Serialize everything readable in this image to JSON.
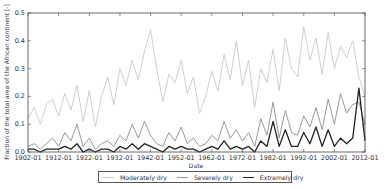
{
  "chart_data": {
    "type": "line",
    "title": "",
    "xlabel": "Date",
    "ylabel": "Fraction of the total area of the African continent [-]",
    "xlim": [
      1902,
      2012
    ],
    "ylim": [
      0.0,
      0.5
    ],
    "x_ticks": [
      "1902-01",
      "1912-01",
      "1922-01",
      "1932-01",
      "1942-01",
      "1952-01",
      "1962-01",
      "1972-01",
      "1982-01",
      "1992-01",
      "2002-01",
      "2012-01"
    ],
    "y_ticks": [
      "0.0",
      "0.1",
      "0.2",
      "0.3",
      "0.4",
      "0.5"
    ],
    "grid": false,
    "legend_position": "below",
    "x": [
      1902,
      1904,
      1906,
      1908,
      1910,
      1912,
      1914,
      1916,
      1918,
      1920,
      1922,
      1924,
      1926,
      1928,
      1930,
      1932,
      1934,
      1936,
      1938,
      1940,
      1942,
      1944,
      1946,
      1948,
      1950,
      1952,
      1954,
      1956,
      1958,
      1960,
      1962,
      1964,
      1966,
      1968,
      1970,
      1972,
      1974,
      1976,
      1978,
      1980,
      1982,
      1984,
      1986,
      1988,
      1990,
      1992,
      1994,
      1996,
      1998,
      2000,
      2002,
      2004,
      2006,
      2008,
      2010,
      2012
    ],
    "series": [
      {
        "name": "Moderately dry",
        "color": "#c8c8c8",
        "values": [
          0.12,
          0.16,
          0.1,
          0.17,
          0.19,
          0.13,
          0.21,
          0.15,
          0.24,
          0.11,
          0.22,
          0.09,
          0.2,
          0.27,
          0.17,
          0.3,
          0.24,
          0.33,
          0.26,
          0.36,
          0.44,
          0.3,
          0.18,
          0.28,
          0.25,
          0.33,
          0.21,
          0.27,
          0.14,
          0.2,
          0.29,
          0.22,
          0.35,
          0.26,
          0.4,
          0.24,
          0.33,
          0.16,
          0.3,
          0.25,
          0.37,
          0.22,
          0.41,
          0.3,
          0.27,
          0.45,
          0.33,
          0.41,
          0.28,
          0.43,
          0.3,
          0.38,
          0.34,
          0.4,
          0.27,
          0.2
        ]
      },
      {
        "name": "Severely dry",
        "color": "#999999",
        "values": [
          0.02,
          0.03,
          0.01,
          0.03,
          0.05,
          0.02,
          0.07,
          0.04,
          0.1,
          0.02,
          0.05,
          0.01,
          0.03,
          0.04,
          0.02,
          0.06,
          0.04,
          0.1,
          0.05,
          0.11,
          0.06,
          0.03,
          0.02,
          0.07,
          0.04,
          0.09,
          0.03,
          0.05,
          0.02,
          0.03,
          0.06,
          0.04,
          0.11,
          0.05,
          0.08,
          0.04,
          0.07,
          0.02,
          0.12,
          0.06,
          0.18,
          0.05,
          0.15,
          0.07,
          0.06,
          0.13,
          0.09,
          0.16,
          0.08,
          0.19,
          0.1,
          0.21,
          0.14,
          0.17,
          0.18,
          0.1
        ]
      },
      {
        "name": "Extremely dry",
        "color": "#222222",
        "values": [
          0.01,
          0.01,
          0.0,
          0.01,
          0.01,
          0.01,
          0.02,
          0.01,
          0.03,
          0.0,
          0.01,
          0.0,
          0.01,
          0.01,
          0.0,
          0.02,
          0.01,
          0.03,
          0.01,
          0.03,
          0.02,
          0.01,
          0.0,
          0.02,
          0.01,
          0.02,
          0.01,
          0.01,
          0.0,
          0.01,
          0.02,
          0.01,
          0.04,
          0.01,
          0.02,
          0.01,
          0.02,
          0.0,
          0.04,
          0.02,
          0.11,
          0.02,
          0.08,
          0.02,
          0.02,
          0.07,
          0.03,
          0.09,
          0.02,
          0.08,
          0.02,
          0.05,
          0.03,
          0.05,
          0.23,
          0.04
        ]
      }
    ]
  },
  "legend": {
    "items": [
      {
        "label": "Moderately dry",
        "color": "#c8c8c8",
        "width": 1
      },
      {
        "label": "Severely dry",
        "color": "#999999",
        "width": 1
      },
      {
        "label": "Extremely dry",
        "color": "#222222",
        "width": 1.6
      }
    ]
  }
}
